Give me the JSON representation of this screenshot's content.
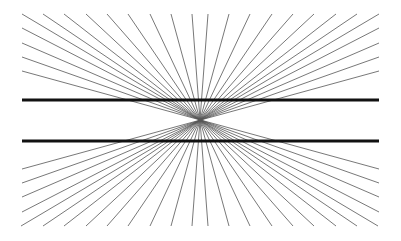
{
  "figure": {
    "name": "Hering illusion",
    "center": [
      200,
      120
    ],
    "ray_box": {
      "left": 22,
      "right": 379,
      "top": 14,
      "bottom": 224
    },
    "top_edge_x": [
      22,
      43,
      64,
      86,
      107,
      128,
      150,
      171,
      192,
      208,
      229,
      250,
      272,
      293,
      314,
      336,
      357,
      379
    ],
    "side_edge_y": [
      28,
      43,
      57,
      71
    ],
    "ray_color": "#555555",
    "horizontal_lines": [
      {
        "y": 100,
        "x1": 22,
        "x2": 379,
        "width": 3.2
      },
      {
        "y": 141,
        "x1": 22,
        "x2": 379,
        "width": 3.2
      }
    ],
    "line_color": "#111111"
  }
}
